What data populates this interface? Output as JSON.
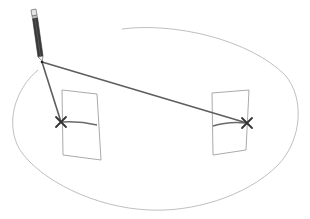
{
  "diagram": {
    "colors": {
      "background": "#ffffff",
      "ellipse_stroke": "#b0b0b0",
      "rect_stroke": "#9a9a9a",
      "line_stroke": "#5a5a5a",
      "x_mark": "#333333",
      "pencil_body": "#3a3a3a",
      "pencil_eraser": "#e0e0e0"
    },
    "ellipse": {
      "cx": 156,
      "cy": 118,
      "rx": 143,
      "ry": 92,
      "gap": "upper-left, near pencil tip"
    },
    "pencil": {
      "eraser": [
        34,
        11
      ],
      "tip": [
        42,
        62
      ]
    },
    "left_target": {
      "rect": [
        [
          62,
          90
        ],
        [
          97,
          94
        ],
        [
          101,
          160
        ],
        [
          63,
          155
        ]
      ],
      "x_mark": [
        61,
        122
      ],
      "curve_end": [
        97,
        125
      ]
    },
    "right_target": {
      "rect": [
        [
          212,
          93
        ],
        [
          249,
          90
        ],
        [
          246,
          150
        ],
        [
          213,
          155
        ]
      ],
      "x_mark": [
        247,
        123
      ],
      "curve_start": [
        213,
        125
      ]
    },
    "lines": [
      {
        "from": "pencil-tip",
        "to": "left-x-mark"
      },
      {
        "from": "pencil-tip",
        "to": "right-x-mark"
      }
    ]
  }
}
